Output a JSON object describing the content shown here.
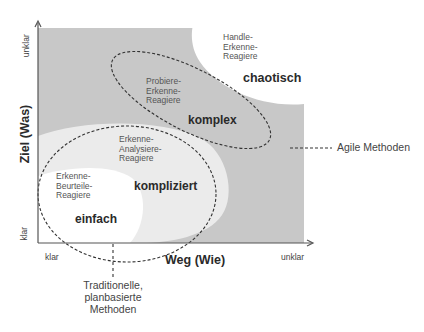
{
  "diagram": {
    "axes": {
      "x": {
        "title": "Weg (Wie)",
        "low": "klar",
        "high": "unklar"
      },
      "y": {
        "title": "Ziel (Was)",
        "low": "klar",
        "high": "unklar"
      }
    },
    "regions": [
      {
        "name": "einfach",
        "approach": "Erkenne-\nBeurteile-\nReagiere",
        "fill": "#ffffff"
      },
      {
        "name": "kompliziert",
        "approach": "Erkenne-\nAnalysiere-\nReagiere",
        "fill": "#ebebeb"
      },
      {
        "name": "komplex",
        "approach": "Probiere-\nErkenne-\nReagiere",
        "fill": "#c8c8c8"
      },
      {
        "name": "chaotisch",
        "approach": "Handle-\nErkenne-\nReagiere",
        "fill": "#ffffff"
      }
    ],
    "annotations": {
      "agile": "Agile Methoden",
      "traditional": "Traditionelle,\nplanbasierte\nMethoden"
    },
    "colors": {
      "complex_fill": "#c8c8c8",
      "complicated_fill": "#ebebeb",
      "axis": "#555555",
      "dashed": "#333333"
    }
  }
}
